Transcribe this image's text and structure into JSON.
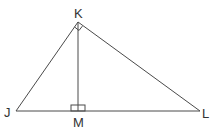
{
  "diagram": {
    "type": "right-triangle-with-altitude",
    "points": {
      "J": {
        "label": "J",
        "x": 16,
        "y": 111
      },
      "K": {
        "label": "K",
        "x": 78,
        "y": 22
      },
      "L": {
        "label": "L",
        "x": 200,
        "y": 111
      },
      "M": {
        "label": "M",
        "x": 78,
        "y": 111
      }
    },
    "segments": [
      "JK",
      "KL",
      "JL",
      "KM"
    ],
    "right_angles": [
      "K",
      "M"
    ],
    "stroke_color": "#4a4a4a",
    "label_color": "#333333"
  }
}
